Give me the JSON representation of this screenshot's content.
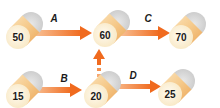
{
  "diagram": {
    "colors": {
      "cylinder_body": "#f5c98a",
      "cylinder_body_dark": "#eca75a",
      "cylinder_face": "#fbf0d2",
      "cylinder_back": "#d6d6d6",
      "arrow": "#f06a1e",
      "arrow_light": "#f7b27c"
    },
    "nodes": [
      {
        "id": "n50",
        "label": "50"
      },
      {
        "id": "n60",
        "label": "60"
      },
      {
        "id": "n70",
        "label": "70"
      },
      {
        "id": "n15",
        "label": "15"
      },
      {
        "id": "n20",
        "label": "20"
      },
      {
        "id": "n25",
        "label": "25"
      }
    ],
    "edges": [
      {
        "id": "A",
        "label": "A",
        "from": "50",
        "to": "60",
        "style": "solid"
      },
      {
        "id": "C",
        "label": "C",
        "from": "60",
        "to": "70",
        "style": "solid"
      },
      {
        "id": "B",
        "label": "B",
        "from": "15",
        "to": "20",
        "style": "solid"
      },
      {
        "id": "D",
        "label": "D",
        "from": "20",
        "to": "25",
        "style": "solid"
      },
      {
        "id": "up",
        "label": "",
        "from": "20",
        "to": "60",
        "style": "dashed"
      }
    ]
  }
}
